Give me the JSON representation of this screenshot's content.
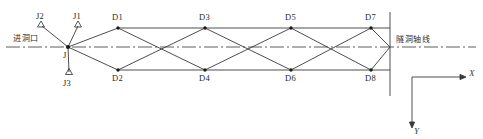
{
  "figure": {
    "kind": "survey-traverse-network-diagram",
    "centerline_label": "隧洞轴线",
    "entrance_label": "进洞口",
    "origin_station_label": "J",
    "axis_x_label": "X",
    "axis_y_label": "Y",
    "colors": {
      "line": "#3a3a3a",
      "centerline": "#4a4a4a",
      "node_fill": "#1a1a1a",
      "text": "#2a2a2a",
      "background": "#ffffff"
    }
  },
  "control_points": [
    {
      "label": "J1",
      "x": 78,
      "y": 25,
      "marker": "triangle"
    },
    {
      "label": "J2",
      "x": 41,
      "y": 25,
      "marker": "triangle"
    },
    {
      "label": "J3",
      "x": 69,
      "y": 73,
      "marker": "triangle"
    },
    {
      "label": "J",
      "x": 68,
      "y": 47,
      "marker": "dot"
    }
  ],
  "upper_nodes": [
    {
      "label": "D1",
      "x": 118,
      "y": 28
    },
    {
      "label": "D3",
      "x": 205,
      "y": 28
    },
    {
      "label": "D5",
      "x": 291,
      "y": 28
    },
    {
      "label": "D7",
      "x": 371,
      "y": 28
    }
  ],
  "lower_nodes": [
    {
      "label": "D2",
      "x": 118,
      "y": 70
    },
    {
      "label": "D4",
      "x": 205,
      "y": 70
    },
    {
      "label": "D6",
      "x": 291,
      "y": 70
    },
    {
      "label": "D8",
      "x": 371,
      "y": 70
    }
  ],
  "centerline_crossings": [
    {
      "x": 68,
      "y": 47
    },
    {
      "x": 161,
      "y": 47
    },
    {
      "x": 248,
      "y": 47
    },
    {
      "x": 331,
      "y": 47
    },
    {
      "x": 390,
      "y": 47
    }
  ],
  "chord_lines": {
    "top": {
      "from_x": 118,
      "to_x": 390,
      "y": 28
    },
    "bottom": {
      "from_x": 118,
      "to_x": 390,
      "y": 70
    }
  },
  "end_section_line": {
    "x": 390,
    "y1": 12,
    "y2": 96
  },
  "centerline": {
    "x1": 6,
    "x2": 476,
    "y": 47
  },
  "axes": {
    "origin_x": 412,
    "origin_y": 77,
    "x_end": 466,
    "y_end": 128
  }
}
